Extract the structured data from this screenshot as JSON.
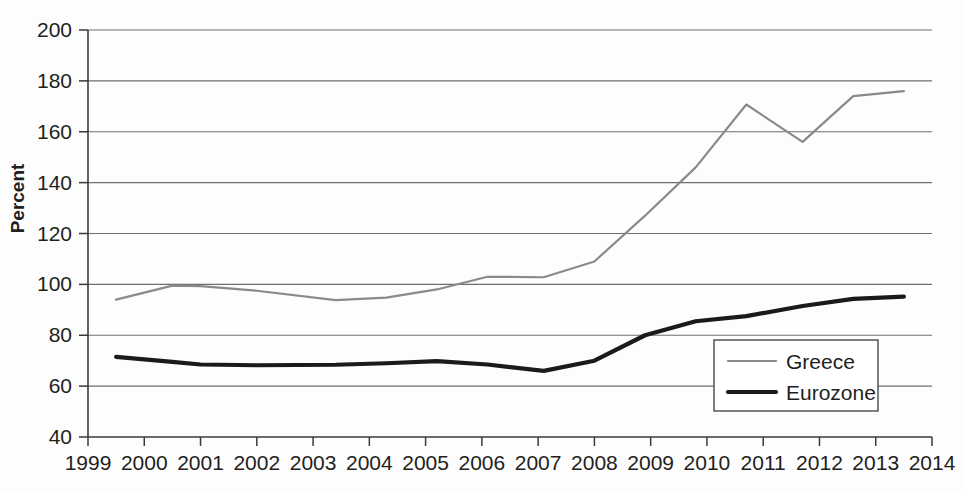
{
  "chart_data": {
    "type": "line",
    "title": "",
    "subtitle": "",
    "xlabel": "",
    "ylabel": "Percent",
    "xlim": [
      1999,
      2014
    ],
    "ylim": [
      40,
      200
    ],
    "ytick_step": 20,
    "grid": true,
    "grid_axis": "y",
    "legend_position": "inside-bottom-right",
    "yticks": [
      40,
      60,
      80,
      100,
      120,
      140,
      160,
      180,
      200
    ],
    "xticks": [
      1999,
      2000,
      2001,
      2002,
      2003,
      2004,
      2005,
      2006,
      2007,
      2008,
      2009,
      2010,
      2011,
      2012,
      2013,
      2014
    ],
    "x": [
      1999.5,
      2000.5,
      2001.0,
      2002.0,
      2003.4,
      2004.3,
      2005.2,
      2006.1,
      2007.1,
      2008.0,
      2008.9,
      2009.8,
      2010.7,
      2011.7,
      2012.6,
      2013.5
    ],
    "series": [
      {
        "name": "Greece",
        "color": "#8a8a8a",
        "line_width": 2.2,
        "values": [
          94,
          99.5,
          99.3,
          97.5,
          93.8,
          94.8,
          98.0,
          103.0,
          102.8,
          109.0,
          127.0,
          146.0,
          170.7,
          156.0,
          174.0,
          176.0
        ]
      },
      {
        "name": "Eurozone",
        "color": "#1a1a1a",
        "line_width": 4.2,
        "values": [
          71.5,
          69.5,
          68.5,
          68.2,
          68.4,
          69.0,
          69.8,
          68.5,
          66.0,
          70.0,
          80.0,
          85.5,
          87.5,
          91.5,
          94.3,
          95.2
        ]
      }
    ]
  },
  "legend": {
    "entries": [
      {
        "label": "Greece",
        "swatch": "greece-line-swatch"
      },
      {
        "label": "Eurozone",
        "swatch": "eurozone-line-swatch"
      }
    ]
  },
  "axes": {
    "y_title": "Percent"
  }
}
